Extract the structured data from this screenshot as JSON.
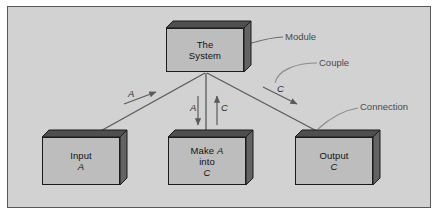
{
  "figure": {
    "background_color": "#d2d2d2",
    "frame_border_color": "#585858",
    "box_fill_color": "#bdbdbd",
    "box_top_face_color": "#4f4f4f",
    "box_side_face_color": "#636363",
    "box_outline_color": "#1b1b1b",
    "line_color": "#5a5a5a",
    "annotation_color": "#4a4a4a"
  },
  "boxes": [
    {
      "id": "the-system",
      "name": "the-system-box",
      "lines": [
        "The",
        "System"
      ],
      "text": "The\nSystem"
    },
    {
      "id": "input-a",
      "name": "input-a-box",
      "lines": [
        "Input",
        "A"
      ],
      "text": "Input\nA"
    },
    {
      "id": "make-a-into-c",
      "name": "make-a-into-c-box",
      "lines": [
        "Make A",
        "into",
        "C"
      ],
      "text": "Make A\ninto\nC"
    },
    {
      "id": "output-c",
      "name": "output-c-box",
      "lines": [
        "Output",
        "C"
      ],
      "text": "Output\nC"
    }
  ],
  "annotations": [
    {
      "id": "module",
      "label": "Module"
    },
    {
      "id": "couple",
      "label": "Couple"
    },
    {
      "id": "connection",
      "label": "Connection"
    }
  ],
  "edge_labels": [
    {
      "id": "left-a",
      "label": "A",
      "direction": "up-right"
    },
    {
      "id": "center-a",
      "label": "A",
      "direction": "down"
    },
    {
      "id": "center-c",
      "label": "C",
      "direction": "up"
    },
    {
      "id": "right-c",
      "label": "C",
      "direction": "down-right"
    }
  ],
  "chart_data": {
    "type": "diagram",
    "nodes": [
      {
        "id": "the-system",
        "label": "The System",
        "x": 166,
        "y": 28,
        "w": 78,
        "h": 44
      },
      {
        "id": "input-a",
        "label": "Input A",
        "x": 42,
        "y": 137,
        "w": 78,
        "h": 48
      },
      {
        "id": "make-a-into-c",
        "label": "Make A into C",
        "x": 168,
        "y": 137,
        "w": 78,
        "h": 48
      },
      {
        "id": "output-c",
        "label": "Output C",
        "x": 295,
        "y": 137,
        "w": 78,
        "h": 48
      }
    ],
    "edges": [
      {
        "from": "the-system",
        "to": "input-a",
        "kind": "connection",
        "couple": "A",
        "couple_direction": "to-the-system"
      },
      {
        "from": "the-system",
        "to": "make-a-into-c",
        "kind": "connection",
        "couples": [
          "A",
          "C"
        ],
        "couple_directions": [
          "to-make-a-into-c",
          "to-the-system"
        ]
      },
      {
        "from": "the-system",
        "to": "output-c",
        "kind": "connection",
        "couple": "C",
        "couple_direction": "to-output-c"
      }
    ],
    "callouts": [
      {
        "label": "Module",
        "target": "the-system"
      },
      {
        "label": "Couple",
        "target": "right-c-arrow"
      },
      {
        "label": "Connection",
        "target": "the-system-to-output-c-line"
      }
    ]
  }
}
